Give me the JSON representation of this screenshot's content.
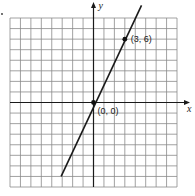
{
  "chart_data": {
    "type": "line",
    "title": "",
    "xlabel": "x",
    "ylabel": "y",
    "xlim": [
      -8,
      8
    ],
    "ylim": [
      -8,
      8
    ],
    "grid": true,
    "grid_step": 1,
    "series": [
      {
        "name": "y = 2x",
        "x": [
          -3.1,
          4.6
        ],
        "y": [
          -7.0,
          9.2
        ]
      }
    ],
    "points": [
      {
        "x": 3,
        "y": 6,
        "label": "(3, 6)"
      },
      {
        "x": 0,
        "y": 0,
        "label": "(0, 0)"
      }
    ],
    "colors": {
      "line": "#1a1a1a",
      "grid": "#8a8a8a"
    }
  }
}
